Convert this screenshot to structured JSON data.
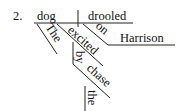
{
  "item_number": "2.",
  "diagram_type": "Reed-Kellogg sentence diagram",
  "sentence": {
    "subject": "dog",
    "predicate": "drooled",
    "subject_modifiers": [
      "The",
      "excited"
    ],
    "phrase_on": {
      "preposition": "on",
      "object": "Harrison"
    },
    "phrase_by": {
      "preposition": "by",
      "object": "chase",
      "object_modifier": "the"
    }
  },
  "colors": {
    "background": "#ffffff",
    "ink": "#111111"
  }
}
